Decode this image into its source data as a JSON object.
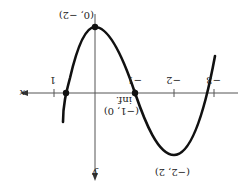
{
  "figure": {
    "orientation": "rotated-180",
    "axes": {
      "x_label": "x",
      "y_label": "y",
      "x_ticks": [
        "1",
        "−1",
        "−2",
        "−3"
      ]
    },
    "points": [
      {
        "label": "(0, −2)",
        "role": "relative-max-in-view"
      },
      {
        "label": "(−1, 0)",
        "role": "inflection",
        "note": "inf."
      },
      {
        "label": "(−2, 2)",
        "role": "relative-min-in-view"
      }
    ],
    "labels": {
      "top_point": "(0, −2)",
      "inflection_note": "inf.",
      "inflection_point": "(−1, 0)",
      "bottom_point": "(−2, 2)"
    },
    "colors": {
      "curve": "#111111",
      "axis": "#555555",
      "background": "#ffffff"
    }
  }
}
